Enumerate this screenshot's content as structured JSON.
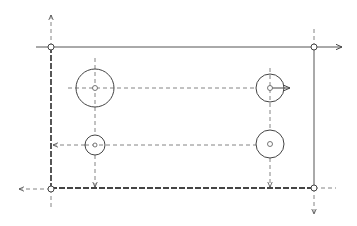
{
  "diagram": {
    "type": "technical-drawing",
    "plate": {
      "edges": {
        "top": "solid",
        "right": "solid",
        "bottom": "thick-dashed",
        "left": "thick-dashed"
      },
      "corner_nodes": [
        "top-left",
        "top-right",
        "bottom-right",
        "bottom-left"
      ]
    },
    "holes": [
      {
        "id": "hole-top-left",
        "size": "large"
      },
      {
        "id": "hole-top-right",
        "size": "medium"
      },
      {
        "id": "hole-bottom-left",
        "size": "small"
      },
      {
        "id": "hole-bottom-right",
        "size": "medium"
      }
    ],
    "arrows": [
      {
        "id": "arrow-up-top-left",
        "direction": "up"
      },
      {
        "id": "arrow-right-top-edge",
        "direction": "right"
      },
      {
        "id": "arrow-right-top-right-hole",
        "direction": "right"
      },
      {
        "id": "arrow-left-bottom-left-hole",
        "direction": "left"
      },
      {
        "id": "arrow-down-bottom-left-hole",
        "direction": "down"
      },
      {
        "id": "arrow-down-bottom-right-hole",
        "direction": "down"
      },
      {
        "id": "arrow-left-bottom-edge",
        "direction": "left"
      },
      {
        "id": "arrow-down-bottom-right",
        "direction": "down"
      }
    ],
    "colors": {
      "line": "#444444",
      "background": "#ffffff"
    }
  }
}
